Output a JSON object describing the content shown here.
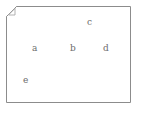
{
  "diagram": {
    "type": "folded-corner-page-with-labels",
    "background_color": "#ffffff",
    "sheet": {
      "name": "note-sheet",
      "border_color": "#8c8c8c",
      "fill_color": "#ffffff",
      "fold_corner": "top-left",
      "fold_size_px": 10
    },
    "labels": [
      {
        "id": "a",
        "text": "a",
        "color": "#6b6b6b",
        "x": 34,
        "y": 48
      },
      {
        "id": "b",
        "text": "b",
        "color": "#6b6b6b",
        "x": 72,
        "y": 48
      },
      {
        "id": "c",
        "text": "c",
        "color": "#6b6b6b",
        "x": 89,
        "y": 22
      },
      {
        "id": "d",
        "text": "d",
        "color": "#6b6b6b",
        "x": 105,
        "y": 48
      },
      {
        "id": "e",
        "text": "e",
        "color": "#6b6b6b",
        "x": 25,
        "y": 80
      }
    ]
  }
}
